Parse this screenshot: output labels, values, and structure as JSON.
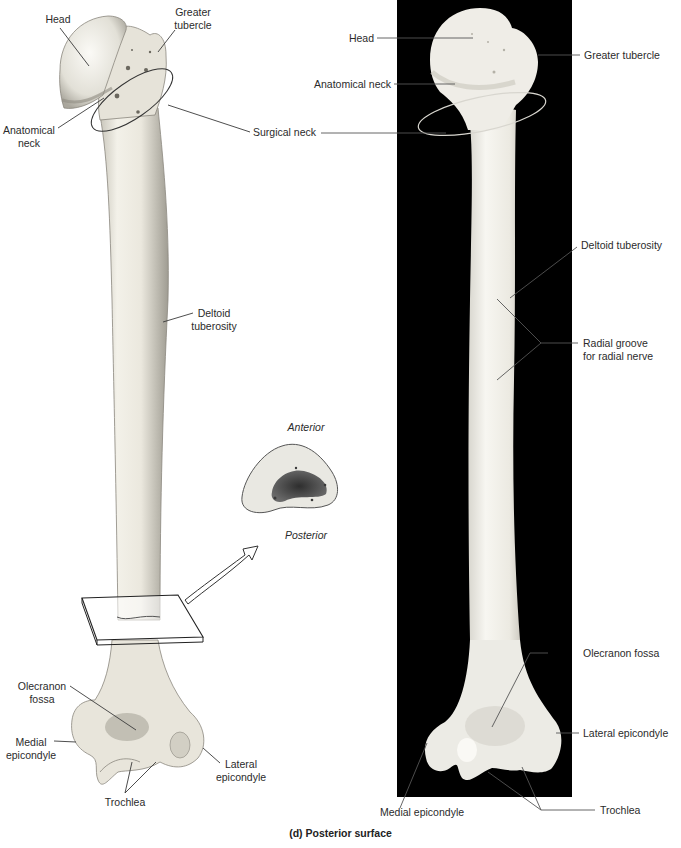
{
  "figure": {
    "caption": "(d) Posterior surface"
  },
  "illustration": {
    "labels": {
      "head": "Head",
      "greater_tubercle_1": "Greater",
      "greater_tubercle_2": "tubercle",
      "anatomical_neck_1": "Anatomical",
      "anatomical_neck_2": "neck",
      "surgical_neck": "Surgical neck",
      "deltoid_tuberosity_1": "Deltoid",
      "deltoid_tuberosity_2": "tuberosity",
      "olecranon_fossa_1": "Olecranon",
      "olecranon_fossa_2": "fossa",
      "medial_epicondyle_1": "Medial",
      "medial_epicondyle_2": "epicondyle",
      "lateral_epicondyle_1": "Lateral",
      "lateral_epicondyle_2": "epicondyle",
      "trochlea": "Trochlea"
    }
  },
  "cross_section": {
    "top_label": "Anterior",
    "bottom_label": "Posterior"
  },
  "photo": {
    "labels": {
      "head": "Head",
      "greater_tubercle": "Greater tubercle",
      "anatomical_neck": "Anatomical neck",
      "deltoid_tuberosity": "Deltoid tuberosity",
      "radial_groove_1": "Radial groove",
      "radial_groove_2": "for radial nerve",
      "olecranon_fossa": "Olecranon fossa",
      "lateral_epicondyle": "Lateral epicondyle",
      "medial_epicondyle": "Medial epicondyle",
      "trochlea": "Trochlea"
    }
  },
  "colors": {
    "background": "#ffffff",
    "photo_background": "#000000",
    "bone_light": "#f1efe6",
    "bone_shadow": "#b9b6ab",
    "leader_line": "#3a3a3a",
    "cross_section_fill": "#e9e8e2",
    "marrow": "#3c3c3c"
  }
}
